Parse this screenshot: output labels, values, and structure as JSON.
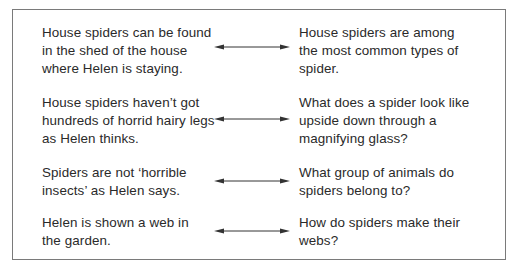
{
  "figure": {
    "rows": [
      {
        "left": [
          "House spiders can be found",
          "in the shed of the house",
          "where Helen is staying."
        ],
        "right": [
          "House spiders are among",
          "the most common types of",
          "spider."
        ]
      },
      {
        "left": [
          "House spiders haven’t got",
          "hundreds of horrid hairy legs",
          "as Helen thinks."
        ],
        "right": [
          "What does a spider look like",
          "upside down through a",
          "magnifying glass?"
        ]
      },
      {
        "left": [
          "Spiders are not ‘horrible",
          "insects’ as Helen says."
        ],
        "right": [
          "What group of animals do",
          "spiders belong to?"
        ]
      },
      {
        "left": [
          "Helen is shown a web in",
          "the garden."
        ],
        "right": [
          "How do spiders make their",
          "webs?"
        ]
      }
    ],
    "connector_icon": "double-headed-arrow-icon",
    "colors": {
      "text": "#2a2a2a",
      "border": "#7a7a7a",
      "arrow": "#333333"
    }
  }
}
